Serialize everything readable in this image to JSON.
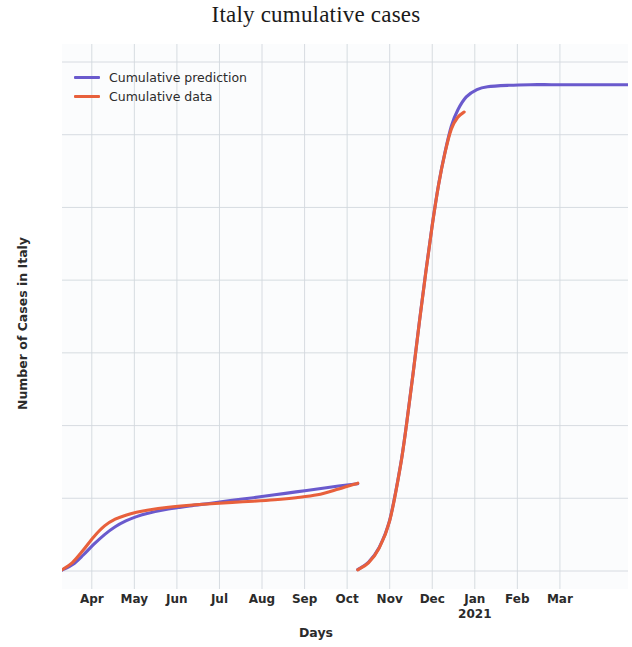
{
  "title": "Italy cumulative cases",
  "axes": {
    "xlabel": "Days",
    "ylabel": "Number of Cases in Italy",
    "offset_text": "1e6"
  },
  "legend": {
    "entries": [
      {
        "label": "Cumulative prediction",
        "color": "#6a5acd"
      },
      {
        "label": "Cumulative data",
        "color": "#e8603c"
      }
    ]
  },
  "chart_data": {
    "type": "line",
    "title": "Italy cumulative cases",
    "xlabel": "Days",
    "ylabel": "Number of Cases in Italy",
    "y_offset_multiplier": "1e6",
    "grid": true,
    "legend_position": "upper left",
    "xlim": [
      0,
      13.3
    ],
    "ylim": [
      0,
      1.8
    ],
    "ytick_labels": [
      "0.00",
      "0.25",
      "0.50",
      "0.75",
      "1.00",
      "1.25",
      "1.50",
      "1.75"
    ],
    "ytick_values": [
      0.0,
      0.25,
      0.5,
      0.75,
      1.0,
      1.25,
      1.5,
      1.75
    ],
    "xtick_labels": [
      "Apr",
      "May",
      "Jun",
      "Jul",
      "Aug",
      "Sep",
      "Oct",
      "Nov",
      "Dec",
      "Jan",
      "Feb",
      "Mar"
    ],
    "xtick_sublabels": [
      "",
      "",
      "",
      "",
      "",
      "",
      "",
      "",
      "",
      "2021",
      "",
      ""
    ],
    "xtick_positions": [
      0.7,
      1.7,
      2.7,
      3.7,
      4.7,
      5.7,
      6.7,
      7.7,
      8.7,
      9.7,
      10.7,
      11.7
    ],
    "series": [
      {
        "name": "Cumulative prediction",
        "color": "#6a5acd",
        "segments": [
          {
            "segment": "first-wave",
            "x": [
              0.0,
              0.25,
              0.5,
              0.75,
              1.0,
              1.25,
              1.5,
              1.75,
              2.0,
              2.5,
              3.0,
              3.5,
              4.0,
              4.5,
              5.0,
              5.5,
              6.0,
              6.5,
              6.95
            ],
            "y": [
              0.003,
              0.022,
              0.055,
              0.092,
              0.125,
              0.152,
              0.172,
              0.187,
              0.198,
              0.213,
              0.224,
              0.233,
              0.243,
              0.252,
              0.262,
              0.272,
              0.282,
              0.292,
              0.3
            ]
          },
          {
            "segment": "second-wave",
            "x": [
              6.95,
              7.2,
              7.45,
              7.7,
              7.95,
              8.1,
              8.25,
              8.4,
              8.55,
              8.7,
              8.85,
              9.0,
              9.15,
              9.3,
              9.5,
              9.75,
              10.0,
              10.5,
              11.0,
              11.5,
              12.0,
              12.6,
              13.3
            ],
            "y": [
              0.005,
              0.03,
              0.08,
              0.175,
              0.36,
              0.51,
              0.68,
              0.86,
              1.03,
              1.19,
              1.33,
              1.44,
              1.53,
              1.585,
              1.63,
              1.655,
              1.665,
              1.67,
              1.672,
              1.672,
              1.672,
              1.672,
              1.672
            ]
          }
        ]
      },
      {
        "name": "Cumulative data",
        "color": "#e8603c",
        "segments": [
          {
            "segment": "first-wave",
            "x": [
              0.0,
              0.25,
              0.5,
              0.75,
              1.0,
              1.25,
              1.5,
              1.75,
              2.0,
              2.5,
              3.0,
              3.5,
              4.0,
              4.5,
              5.0,
              5.5,
              6.0,
              6.5,
              6.95
            ],
            "y": [
              0.004,
              0.03,
              0.072,
              0.118,
              0.155,
              0.178,
              0.192,
              0.202,
              0.209,
              0.219,
              0.226,
              0.231,
              0.236,
              0.24,
              0.245,
              0.252,
              0.262,
              0.282,
              0.302
            ]
          },
          {
            "segment": "second-wave",
            "x": [
              6.95,
              7.2,
              7.45,
              7.7,
              7.95,
              8.1,
              8.25,
              8.4,
              8.55,
              8.7,
              8.85,
              9.0,
              9.15,
              9.3,
              9.45
            ],
            "y": [
              0.004,
              0.028,
              0.078,
              0.172,
              0.358,
              0.508,
              0.678,
              0.858,
              1.028,
              1.188,
              1.328,
              1.438,
              1.52,
              1.56,
              1.578
            ]
          }
        ]
      }
    ]
  }
}
